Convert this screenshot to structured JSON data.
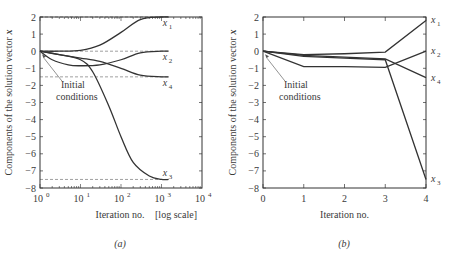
{
  "chart_data": [
    {
      "type": "line",
      "panel_label": "(a)",
      "title": "",
      "xlabel": "Iteration no.",
      "xlabel_note": "[log scale]",
      "ylabel": "Components of the solution vector x",
      "xscale": "log",
      "xlim": [
        1,
        10000
      ],
      "ylim": [
        -8,
        2
      ],
      "xticks": [
        "10^0",
        "10^1",
        "10^2",
        "10^3",
        "10^4"
      ],
      "yticks": [
        2,
        1,
        0,
        -1,
        -2,
        -3,
        -4,
        -5,
        -6,
        -7,
        -8
      ],
      "grid": false,
      "reference_lines": [
        {
          "y": 2,
          "style": "dashed",
          "series": "x1"
        },
        {
          "y": 0,
          "style": "dashed",
          "series": "x2"
        },
        {
          "y": -1.5,
          "style": "dashed",
          "series": "x4"
        },
        {
          "y": -7.5,
          "style": "dashed",
          "series": "x3"
        }
      ],
      "annotation": {
        "text": "Initial conditions",
        "line1": "Initial",
        "line2": "conditions",
        "points_to": [
          1,
          0
        ]
      },
      "series": [
        {
          "name": "x1",
          "label": "x",
          "sub": "1",
          "x": [
            1,
            3,
            10,
            30,
            100,
            300,
            1000,
            1500
          ],
          "y": [
            0,
            0,
            0.05,
            0.35,
            1.1,
            1.85,
            2.0,
            2.0
          ]
        },
        {
          "name": "x2",
          "label": "x",
          "sub": "2",
          "x": [
            1,
            2,
            5,
            10,
            30,
            100,
            300,
            1000,
            1500
          ],
          "y": [
            0,
            -0.5,
            -0.8,
            -0.85,
            -0.8,
            -0.5,
            -0.1,
            0,
            0
          ]
        },
        {
          "name": "x4",
          "label": "x",
          "sub": "4",
          "x": [
            1,
            3,
            10,
            30,
            100,
            300,
            1000,
            1500
          ],
          "y": [
            0,
            -0.2,
            -0.4,
            -0.6,
            -1.0,
            -1.4,
            -1.5,
            -1.5
          ]
        },
        {
          "name": "x3",
          "label": "x",
          "sub": "3",
          "x": [
            1,
            3,
            10,
            20,
            50,
            100,
            200,
            500,
            1000,
            1500
          ],
          "y": [
            0,
            -0.2,
            -0.5,
            -1.2,
            -3.2,
            -5.0,
            -6.5,
            -7.3,
            -7.5,
            -7.5
          ]
        }
      ]
    },
    {
      "type": "line",
      "panel_label": "(b)",
      "title": "",
      "xlabel": "Iteration no.",
      "ylabel": "Components of the solution vector x",
      "xscale": "linear",
      "xlim": [
        0,
        4
      ],
      "ylim": [
        -8,
        2
      ],
      "xticks": [
        "0",
        "1",
        "2",
        "3",
        "4"
      ],
      "yticks": [
        2,
        1,
        0,
        -1,
        -2,
        -3,
        -4,
        -5,
        -6,
        -7,
        -8
      ],
      "grid": false,
      "annotation": {
        "text": "Initial conditions",
        "line1": "Initial",
        "line2": "conditions",
        "points_to": [
          0,
          0
        ]
      },
      "series": [
        {
          "name": "x1",
          "label": "x",
          "sub": "1",
          "x": [
            0,
            1,
            2,
            3,
            4
          ],
          "y": [
            0,
            -0.2,
            -0.15,
            -0.05,
            1.8
          ]
        },
        {
          "name": "x2",
          "label": "x",
          "sub": "2",
          "x": [
            0,
            1,
            2,
            3,
            4
          ],
          "y": [
            0,
            -0.9,
            -0.9,
            -0.95,
            0.0
          ]
        },
        {
          "name": "x4",
          "label": "x",
          "sub": "4",
          "x": [
            0,
            1,
            2,
            3,
            4
          ],
          "y": [
            0,
            -0.25,
            -0.35,
            -0.45,
            -1.55
          ]
        },
        {
          "name": "x3",
          "label": "x",
          "sub": "3",
          "x": [
            0,
            1,
            2,
            3,
            4
          ],
          "y": [
            0,
            -0.3,
            -0.4,
            -0.5,
            -7.5
          ]
        }
      ]
    }
  ]
}
